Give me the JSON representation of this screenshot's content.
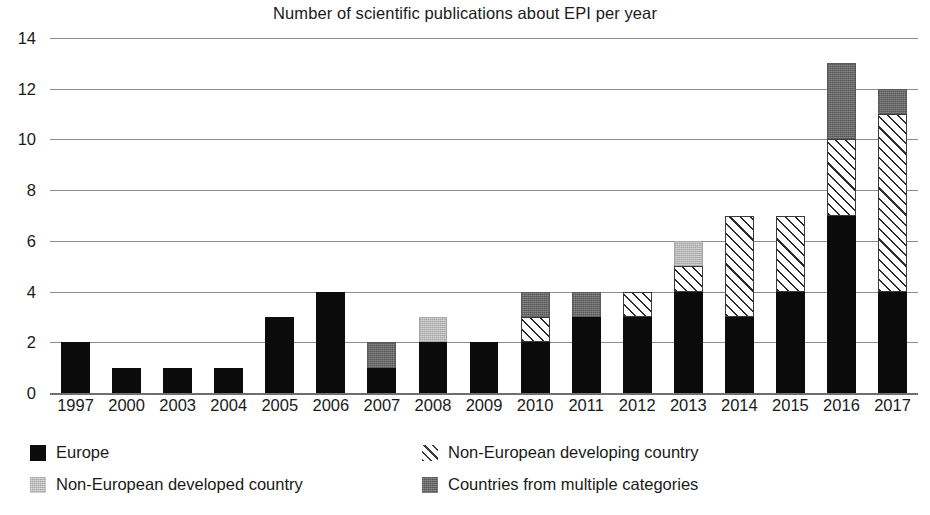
{
  "chart_data": {
    "type": "bar",
    "title": "Number of scientific publications about EPI per year",
    "xlabel": "",
    "ylabel": "",
    "ylim": [
      0,
      14
    ],
    "ytick_step": 2,
    "yticks": [
      0,
      2,
      4,
      6,
      8,
      10,
      12,
      14
    ],
    "grid": "horizontal",
    "stacked": true,
    "legend_position": "bottom",
    "categories": [
      "1997",
      "2000",
      "2003",
      "2004",
      "2005",
      "2006",
      "2007",
      "2008",
      "2009",
      "2010",
      "2011",
      "2012",
      "2013",
      "2014",
      "2015",
      "2016",
      "2017"
    ],
    "series": [
      {
        "name": "Europe",
        "color": "#0b0b0b",
        "pattern": "solid",
        "values": [
          2,
          1,
          1,
          1,
          3,
          4,
          1,
          2,
          2,
          2,
          3,
          3,
          4,
          3,
          4,
          7,
          4
        ]
      },
      {
        "name": "Non-European developed country",
        "color": "#bdbdbd",
        "pattern": "light-speckle",
        "values": [
          0,
          0,
          0,
          0,
          0,
          0,
          0,
          1,
          0,
          0,
          0,
          0,
          1,
          0,
          0,
          0,
          0
        ]
      },
      {
        "name": "Non-European developing country",
        "color": "#ffffff",
        "pattern": "diagonal-hatch",
        "values": [
          0,
          0,
          0,
          0,
          0,
          0,
          0,
          0,
          0,
          1,
          0,
          1,
          1,
          4,
          3,
          3,
          7
        ]
      },
      {
        "name": "Countries from multiple categories",
        "color": "#6a6a6a",
        "pattern": "dark-speckle",
        "values": [
          0,
          0,
          0,
          0,
          0,
          0,
          1,
          0,
          0,
          1,
          1,
          0,
          0,
          0,
          0,
          3,
          1
        ]
      }
    ],
    "totals": [
      2,
      1,
      1,
      1,
      3,
      4,
      2,
      3,
      2,
      4,
      4,
      4,
      6,
      7,
      7,
      13,
      12
    ]
  },
  "legend": {
    "items": [
      {
        "label": "Europe",
        "swatch": "europe"
      },
      {
        "label": "Non-European developing country",
        "swatch": "developing"
      },
      {
        "label": "Non-European developed country",
        "swatch": "developed"
      },
      {
        "label": "Countries from multiple categories",
        "swatch": "multiple"
      }
    ]
  }
}
